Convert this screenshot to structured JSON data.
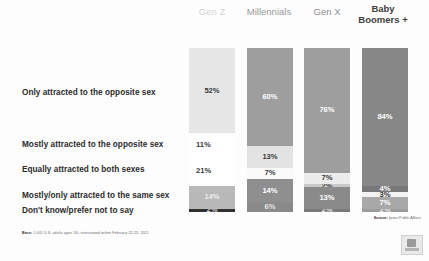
{
  "chart_data": {
    "type": "bar",
    "title": "",
    "subtitle": "",
    "xlabel": "",
    "ylabel": "",
    "ylim": [
      0,
      100
    ],
    "stacked": true,
    "normalized_percent": true,
    "grid": false,
    "legend_position": "left-row-labels",
    "categories": [
      "Gen Z",
      "Millennials",
      "Gen X",
      "Baby Boomers +"
    ],
    "series": [
      {
        "name": "Only attracted to the opposite sex",
        "values": [
          52,
          60,
          76,
          84
        ],
        "labels": [
          "52%",
          "60%",
          "76%",
          "84%"
        ],
        "color": "#e4e4e4"
      },
      {
        "name": "Mostly attracted to the opposite sex",
        "values": [
          11,
          13,
          7,
          4
        ],
        "labels": [
          "11%",
          "13%",
          "7%",
          "4%"
        ],
        "color": "#e4e4e4"
      },
      {
        "name": "Equally attracted to both sexes",
        "values": [
          21,
          7,
          2,
          3
        ],
        "labels": [
          "21%",
          "7%",
          "2%",
          "3%"
        ],
        "color": "#f3f3f3"
      },
      {
        "name": "Mostly/only attracted to the same sex",
        "values": [
          14,
          14,
          13,
          7
        ],
        "labels": [
          "14%",
          "14%",
          "13%",
          "7%"
        ],
        "color": "#9a9a9a"
      },
      {
        "name": "Don't know/prefer not to say",
        "values": [
          2,
          6,
          2,
          2
        ],
        "labels": [
          "2%",
          "6%",
          "2%",
          "2%"
        ],
        "color": "#4a4a4a"
      }
    ]
  },
  "headers": [
    {
      "label": "Gen Z"
    },
    {
      "label": "Millennials"
    },
    {
      "label": "Gen X"
    },
    {
      "label": "Baby\nBoomers +",
      "line1": "Baby",
      "line2": "Boomers +"
    }
  ],
  "row_labels": [
    "Only attracted to the opposite sex",
    "Mostly attracted to the opposite sex",
    "Equally attracted to both sexes",
    "Mostly/only attracted to the same sex",
    "Don't know/prefer not to say"
  ],
  "bars": {
    "genz": {
      "segments": [
        {
          "label": "52%",
          "pct": 52,
          "color": "#e6e6e6",
          "text": "#3a3a3a",
          "show": true
        },
        {
          "label": "11%",
          "pct": 11,
          "color": "#ffffff",
          "text": "#3a3a3a",
          "show": false
        },
        {
          "label": "21%",
          "pct": 21,
          "color": "#ffffff",
          "text": "#3a3a3a",
          "show": false
        },
        {
          "label": "14%",
          "pct": 14,
          "color": "#b9b9b9",
          "text": "#ededed",
          "show": true
        },
        {
          "label": "2%",
          "pct": 2,
          "color": "#2f2f2f",
          "text": "#d8d8d8",
          "show": true
        }
      ]
    },
    "millennials": {
      "segments": [
        {
          "label": "60%",
          "pct": 60,
          "color": "#9e9e9e",
          "text": "#ffffff",
          "show": true
        },
        {
          "label": "13%",
          "pct": 13,
          "color": "#e3e3e3",
          "text": "#3a3a3a",
          "show": true
        },
        {
          "label": "7%",
          "pct": 7,
          "color": "#fafafa",
          "text": "#3a3a3a",
          "show": true
        },
        {
          "label": "14%",
          "pct": 14,
          "color": "#8f8f8f",
          "text": "#ffffff",
          "show": true
        },
        {
          "label": "6%",
          "pct": 6,
          "color": "#8a8a8a",
          "text": "#e8e8e8",
          "show": true
        }
      ]
    },
    "genx": {
      "segments": [
        {
          "label": "76%",
          "pct": 76,
          "color": "#9e9e9e",
          "text": "#ffffff",
          "show": true
        },
        {
          "label": "7%",
          "pct": 7,
          "color": "#ececec",
          "text": "#3a3a3a",
          "show": true
        },
        {
          "label": "2%",
          "pct": 2,
          "color": "#c9c9c9",
          "text": "#4a4a4a",
          "show": true
        },
        {
          "label": "13%",
          "pct": 13,
          "color": "#8a8a8a",
          "text": "#ffffff",
          "show": true
        },
        {
          "label": "2%",
          "pct": 2,
          "color": "#7a7a7a",
          "text": "#e0e0e0",
          "show": true
        }
      ]
    },
    "boomers": {
      "segments": [
        {
          "label": "84%",
          "pct": 84,
          "color": "#878787",
          "text": "#ffffff",
          "show": true
        },
        {
          "label": "4%",
          "pct": 4,
          "color": "#787878",
          "text": "#ffffff",
          "show": true
        },
        {
          "label": "3%",
          "pct": 3,
          "color": "#f2f2f2",
          "text": "#3a3a3a",
          "show": true
        },
        {
          "label": "7%",
          "pct": 7,
          "color": "#a8a8a8",
          "text": "#ffffff",
          "show": true
        },
        {
          "label": "2%",
          "pct": 2,
          "color": "#9c9c9c",
          "text": "#e8e8e8",
          "show": true
        }
      ]
    }
  },
  "outside_labels": {
    "genz_mostly_opposite": "11%",
    "genz_equally_both": "21%"
  },
  "footnote": {
    "prefix": "Base:",
    "text": "1,001 U.S. adults ages 18+ interviewed online February 22-23, 2021"
  },
  "source": {
    "prefix": "Source:",
    "text": "Ipsos Public Affairs"
  },
  "logo": {
    "name": "ipsos-logo"
  }
}
